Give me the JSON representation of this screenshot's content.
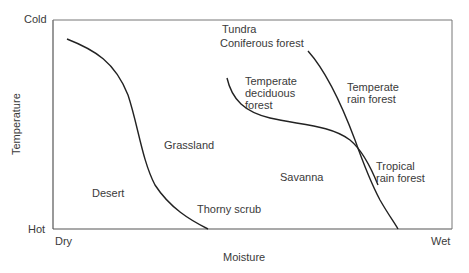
{
  "diagram": {
    "type": "biome-temperature-moisture",
    "axes": {
      "y_label": "Temperature",
      "y_top": "Cold",
      "y_bottom": "Hot",
      "x_label": "Moisture",
      "x_left": "Dry",
      "x_right": "Wet"
    },
    "regions": {
      "tundra": "Tundra",
      "coniferous": "Coniferous forest",
      "temperate_deciduous": [
        "Temperate",
        "deciduous",
        "forest"
      ],
      "temperate_rain": [
        "Temperate",
        "rain forest"
      ],
      "grassland": "Grassland",
      "desert": "Desert",
      "thorny_scrub": "Thorny scrub",
      "savanna": "Savanna",
      "tropical_rain": [
        "Tropical",
        "rain forest"
      ]
    },
    "colors": {
      "line": "#222222",
      "axis": "#555555",
      "text": "#3a3a3a"
    }
  }
}
